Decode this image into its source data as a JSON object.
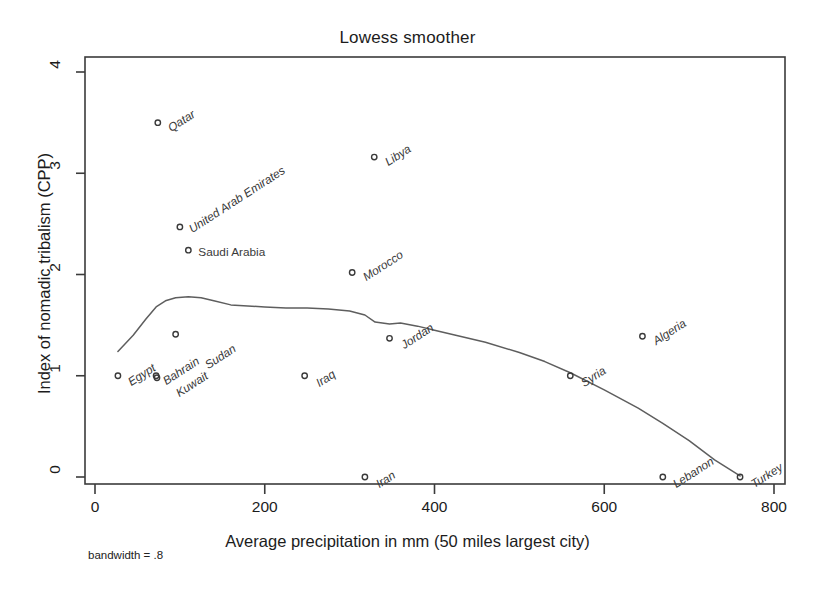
{
  "chart_data": {
    "type": "scatter",
    "title": "Lowess smoother",
    "xlabel": "Average  precipitation in mm (50 miles largest city)",
    "ylabel": "Index of nomadic tribalism (CPP)",
    "note": "bandwidth = .8",
    "xlim": [
      -20,
      815
    ],
    "ylim": [
      -0.18,
      4.12
    ],
    "xticks": [
      0,
      200,
      400,
      600,
      800
    ],
    "xtick_labels": [
      "0",
      "200",
      "400",
      "600",
      "800"
    ],
    "yticks": [
      0,
      1,
      2,
      3,
      4
    ],
    "ytick_labels": [
      "0",
      "1",
      "2",
      "3",
      "4"
    ],
    "grid": false,
    "legend": "none",
    "marker": "open-circle",
    "series": [
      {
        "name": "Countries",
        "points": [
          {
            "label": "Egypt",
            "x": 27,
            "y": 1.0,
            "label_angle": -33,
            "label_dx": 11,
            "label_dy": 7
          },
          {
            "label": "Qatar",
            "x": 74,
            "y": 3.5,
            "label_angle": -33,
            "label_dx": 11,
            "label_dy": 6
          },
          {
            "label": "Bahrain",
            "x": 72,
            "y": 1.0,
            "label_angle": -33,
            "label_dx": 8,
            "label_dy": 6
          },
          {
            "label": "Kuwait",
            "x": 73,
            "y": 0.98,
            "label_angle": -33,
            "label_dx": 20,
            "label_dy": 16
          },
          {
            "label": "Sudan",
            "x": 95,
            "y": 1.41,
            "label_angle": -33,
            "label_dx": 30,
            "label_dy": 32
          },
          {
            "label": "United Arab Emirates",
            "x": 100,
            "y": 2.47,
            "label_angle": -33,
            "label_dx": 10,
            "label_dy": 3
          },
          {
            "label": "Saudi Arabia",
            "x": 110,
            "y": 2.24,
            "label_angle": 0,
            "label_dx": 10,
            "label_dy": 2
          },
          {
            "label": "Iraq",
            "x": 247,
            "y": 1.0,
            "label_angle": -33,
            "label_dx": 12,
            "label_dy": 8
          },
          {
            "label": "Morocco",
            "x": 303,
            "y": 2.02,
            "label_angle": -33,
            "label_dx": 12,
            "label_dy": 6
          },
          {
            "label": "Iran",
            "x": 318,
            "y": 0.0,
            "label_angle": -33,
            "label_dx": 12,
            "label_dy": 8
          },
          {
            "label": "Libya",
            "x": 329,
            "y": 3.16,
            "label_angle": -33,
            "label_dx": 12,
            "label_dy": 6
          },
          {
            "label": "Jordan",
            "x": 347,
            "y": 1.37,
            "label_angle": -33,
            "label_dx": 12,
            "label_dy": 8
          },
          {
            "label": "Syria",
            "x": 560,
            "y": 1.0,
            "label_angle": -33,
            "label_dx": 12,
            "label_dy": 8
          },
          {
            "label": "Algeria",
            "x": 645,
            "y": 1.39,
            "label_angle": -33,
            "label_dx": 12,
            "label_dy": 6
          },
          {
            "label": "Lebanon",
            "x": 669,
            "y": 0.0,
            "label_angle": -33,
            "label_dx": 11,
            "label_dy": 8
          },
          {
            "label": "Turkey",
            "x": 760,
            "y": 0.0,
            "label_angle": -33,
            "label_dx": 12,
            "label_dy": 8
          }
        ]
      }
    ],
    "lowess_curve": {
      "name": "Lowess smoother (bandwidth = .8)",
      "x": [
        27,
        45,
        60,
        72,
        83,
        95,
        110,
        125,
        140,
        160,
        180,
        200,
        225,
        250,
        275,
        300,
        318,
        330,
        347,
        360,
        380,
        400,
        430,
        460,
        500,
        530,
        560,
        600,
        640,
        669,
        700,
        730,
        760
      ],
      "y": [
        1.24,
        1.4,
        1.56,
        1.68,
        1.74,
        1.77,
        1.78,
        1.77,
        1.74,
        1.7,
        1.69,
        1.68,
        1.67,
        1.67,
        1.66,
        1.64,
        1.6,
        1.53,
        1.51,
        1.52,
        1.49,
        1.45,
        1.39,
        1.33,
        1.23,
        1.14,
        1.03,
        0.86,
        0.68,
        0.53,
        0.36,
        0.17,
        0.01
      ]
    },
    "colors": {
      "axis": "#3b3b3b",
      "curve": "#5e5e5e",
      "marker": "#3a3a3a",
      "text": "#1c1c1c",
      "background": "#ffffff"
    }
  }
}
